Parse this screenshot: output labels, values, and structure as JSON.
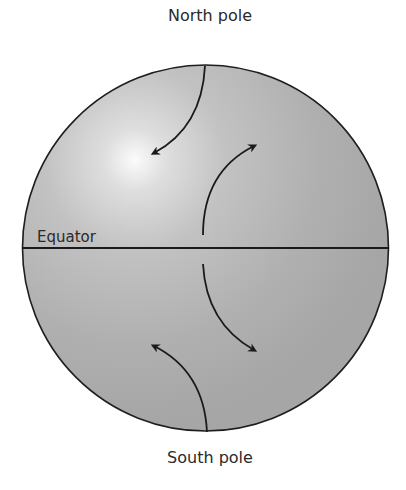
{
  "diagram": {
    "labels": {
      "north_pole": "North pole",
      "south_pole": "South pole",
      "equator": "Equator"
    },
    "globe": {
      "center": [
        205,
        248
      ],
      "radius": 183,
      "fill_light": "#f6f6f6",
      "fill_dark": "#a9a9a9",
      "outline": "#1e1e1e"
    },
    "arrows": [
      {
        "name": "north-pole-downward-arrow",
        "from": "north pole",
        "direction": "down-left"
      },
      {
        "name": "north-equator-upward-arrow",
        "from": "equator",
        "direction": "up-right"
      },
      {
        "name": "south-equator-downward-arrow",
        "from": "equator",
        "direction": "down-right"
      },
      {
        "name": "south-pole-upward-arrow",
        "from": "south pole",
        "direction": "up-left"
      }
    ]
  }
}
